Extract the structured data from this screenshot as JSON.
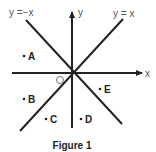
{
  "figure": {
    "caption": "Figure 1",
    "axes": {
      "x_label": "x",
      "y_label": "y",
      "origin_label": "O"
    },
    "lines": [
      {
        "label": "y =−x",
        "equation": "y = -x"
      },
      {
        "label": "y = x",
        "equation": "y = x"
      }
    ],
    "points": [
      {
        "label": "A",
        "region": "between y=-x and negative x-axis, upper-left"
      },
      {
        "label": "B",
        "region": "below negative x-axis, above y=x"
      },
      {
        "label": "C",
        "region": "below y=x, left of negative y-axis"
      },
      {
        "label": "D",
        "region": "right of negative y-axis, left of y=-x"
      },
      {
        "label": "E",
        "region": "below positive x-axis, above y=-x"
      }
    ],
    "colors": {
      "line": "#222222",
      "text": "#555555",
      "background": "#ffffff"
    }
  }
}
